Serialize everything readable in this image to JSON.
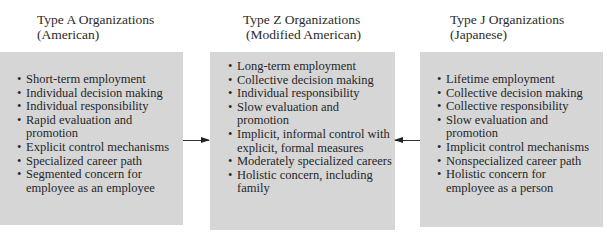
{
  "columns": [
    {
      "title_line1": "Type A Organizations",
      "title_line2": "(American)",
      "items": [
        "Short-term employment",
        "Individual decision making",
        "Individual responsibility",
        "Rapid evaluation and promotion",
        "Explicit control mechanisms",
        "Specialized career path",
        "Segmented concern for employee as an employee"
      ]
    },
    {
      "title_line1": "Type Z Organizations",
      "title_line2": "(Modified American)",
      "items": [
        "Long-term employment",
        "Collective decision making",
        "Individual responsibility",
        "Slow evaluation and promotion",
        "Implicit, informal control with explicit, formal measures",
        "Moderately specialized careers",
        "Holistic concern, including family"
      ]
    },
    {
      "title_line1": "Type J Organizations",
      "title_line2": "(Japanese)",
      "items": [
        "Lifetime employment",
        "Collective decision making",
        "Collective responsibility",
        "Slow evaluation and promotion",
        "Implicit control mechanisms",
        "Nonspecialized career path",
        "Holistic concern for employee as a person"
      ]
    }
  ],
  "arrows": [
    {
      "from": "Type A",
      "to": "Type Z",
      "direction": "right"
    },
    {
      "from": "Type J",
      "to": "Type Z",
      "direction": "left"
    }
  ],
  "colors": {
    "box_fill": "#d6d6d6",
    "text": "#262626",
    "arrow": "#333333"
  }
}
